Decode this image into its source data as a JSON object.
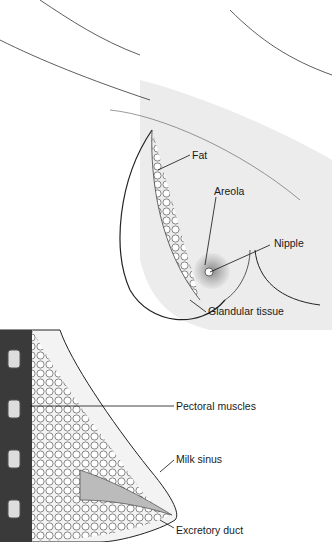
{
  "figure": {
    "front_view": {
      "labels": [
        {
          "text": "Fat",
          "x": 192,
          "y": 149
        },
        {
          "text": "Areola",
          "x": 214,
          "y": 185
        },
        {
          "text": "Nipple",
          "x": 274,
          "y": 237
        },
        {
          "text": "Glandular tissue",
          "x": 208,
          "y": 305
        }
      ]
    },
    "cross_section": {
      "labels": [
        {
          "text": "Pectoral muscles",
          "x": 176,
          "y": 400
        },
        {
          "text": "Milk sinus",
          "x": 176,
          "y": 453
        },
        {
          "text": "Excretory duct",
          "x": 176,
          "y": 524
        }
      ]
    },
    "colors": {
      "background": "#ffffff",
      "shade": "#e9e9e9",
      "line": "#222222",
      "areola": "#bdbdbd"
    }
  }
}
